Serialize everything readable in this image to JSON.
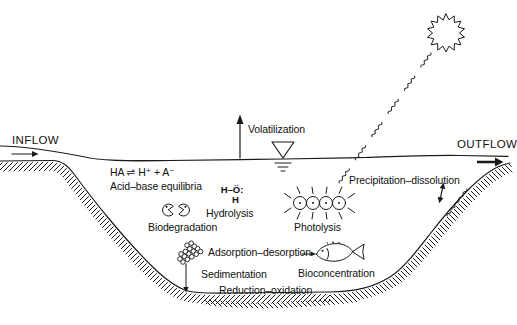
{
  "colors": {
    "ink": "#1a1a1a",
    "paper": "#ffffff",
    "text": "#111111"
  },
  "flow": {
    "inflow_label": "INFLOW",
    "outflow_label": "OUTFLOW"
  },
  "surface": {
    "volatilization_label": "Volatilization"
  },
  "water_column": {
    "acid_base_formula": "HA ⇌ H⁺ + A⁻",
    "acid_base_label": "Acid–base equilibria",
    "biodegradation_label": "Biodegradation",
    "hydrolysis_label": "Hydrolysis",
    "photolysis_label": "Photolysis",
    "precipitation_label": "Precipitation–dissolution",
    "bioconcentration_label": "Bioconcentration"
  },
  "sediment": {
    "adsorption_label": "Adsorption–desorption",
    "sedimentation_label": "Sedimentation",
    "redox_label": "Reduction–oxidation"
  },
  "molecule": {
    "water_top": "H–Ö:",
    "water_bottom": "H"
  },
  "icons": {
    "sun": "wiggly sun disc",
    "light_rays": "squiggly photon rays",
    "water_level_marker": "inverted-triangle water surface symbol",
    "microbes": "two pac-man microbes",
    "water_molecule": "Lewis structure of water",
    "chromophore": "four fused rings absorbing light",
    "particle_cluster": "aggregate of sediment particles",
    "fish": "fish with uptake arrow",
    "inflow_arrow": "→",
    "outflow_arrow": "→",
    "volatilization_arrow": "↑",
    "sedimentation_arrow": "↓",
    "precipitation_arrow": "↕"
  }
}
